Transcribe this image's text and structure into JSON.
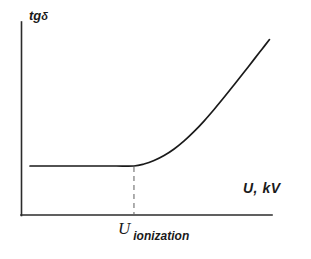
{
  "chart_data": {
    "type": "line",
    "title": "",
    "subtitle": "",
    "ylabel": "tgδ",
    "ylabel_base": "tg",
    "ylabel_symbol": "δ",
    "xlabel": "U, kV",
    "grid": false,
    "legend": false,
    "legend_position": "none",
    "xlim": [
      0,
      100
    ],
    "ylim": [
      0,
      100
    ],
    "axis_ticks": "none",
    "annotations": [
      {
        "name": "ionization-threshold",
        "base": "U",
        "subscript": "ionization",
        "x": 45,
        "marker": "dashed-vertical-line",
        "description": "Ionization onset voltage marked by dashed vertical line at the knee of the curve"
      }
    ],
    "series": [
      {
        "name": "tg delta",
        "color": "#1a1a1a",
        "linewidth": 1.7,
        "x": [
          3.6,
          10,
          17,
          24,
          31,
          38,
          45,
          49,
          53,
          57,
          61,
          65,
          69,
          73,
          77,
          81,
          85,
          89,
          93,
          96,
          99
        ],
        "y": [
          25.4,
          25.4,
          25.4,
          25.4,
          25.4,
          25.4,
          25.4,
          26.4,
          28.2,
          30.8,
          34.2,
          38.4,
          43.3,
          48.8,
          54.8,
          61.1,
          67.6,
          74.2,
          80.9,
          85.9,
          90.9
        ]
      }
    ],
    "threshold_line": {
      "x": 45,
      "y_top": 25.4,
      "y_bottom": 0,
      "style": "dashed",
      "color": "#8c8c8c"
    }
  },
  "colors": {
    "background": "#ffffff",
    "axis": "#2b2b2b",
    "curve": "#1a1a1a",
    "dashed": "#8c8c8c",
    "text": "#1a1a1a"
  }
}
